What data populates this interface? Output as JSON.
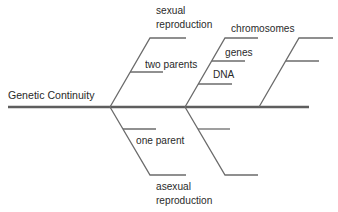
{
  "diagram": {
    "type": "fishbone",
    "title": "Genetic Continuity",
    "line_color": "#6b6b6b",
    "spine_color": "#5e5e5e",
    "branches": [
      {
        "id": "branch-1-upper",
        "label": [
          "sexual",
          "reproduction"
        ],
        "sub_items": [
          {
            "label": "two parents"
          }
        ]
      },
      {
        "id": "branch-1-lower",
        "label": [
          "asexual",
          "reproduction"
        ],
        "sub_items": [
          {
            "label": "one parent"
          }
        ]
      },
      {
        "id": "branch-2-upper",
        "label": [
          "chromosomes"
        ],
        "sub_items": [
          {
            "label": "genes"
          },
          {
            "label": "DNA"
          }
        ]
      },
      {
        "id": "branch-2-lower",
        "label": [
          ""
        ],
        "sub_items": [
          {
            "label": ""
          }
        ]
      },
      {
        "id": "branch-3-upper",
        "label": [
          ""
        ],
        "sub_items": [
          {
            "label": ""
          }
        ]
      }
    ]
  }
}
